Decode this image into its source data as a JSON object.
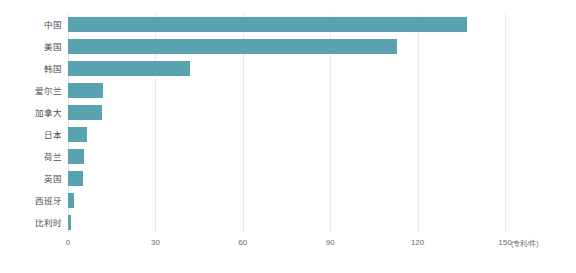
{
  "chart_data": {
    "type": "bar",
    "orientation": "horizontal",
    "title": "",
    "xlabel": "(专利/件)",
    "ylabel": "",
    "xlim": [
      0,
      150
    ],
    "ylim": null,
    "grid": true,
    "legend": false,
    "unit": "(专利/件)",
    "bar_color": "#59a3b0",
    "gridline_color": "#e9eaec",
    "xticks": [
      0,
      30,
      60,
      90,
      120,
      150
    ],
    "xtick_labels": [
      "0",
      "30",
      "60",
      "90",
      "120",
      "150"
    ],
    "categories": [
      "中国",
      "美国",
      "韩国",
      "爱尔兰",
      "加拿大",
      "日本",
      "荷兰",
      "英国",
      "西班牙",
      "比利时"
    ],
    "values": [
      137,
      113,
      42,
      12,
      11.5,
      6.5,
      5.5,
      5,
      2,
      1.2
    ]
  }
}
